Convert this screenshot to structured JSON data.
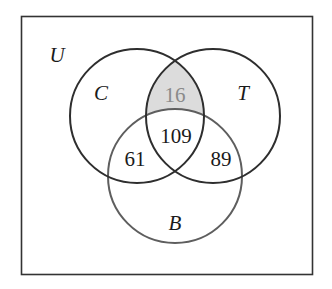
{
  "diagram": {
    "type": "venn",
    "universe": {
      "label": "U",
      "box": {
        "x": 21,
        "y": 16,
        "width": 292,
        "height": 259
      },
      "stroke": "#333333"
    },
    "sets": [
      {
        "id": "C",
        "label": "C",
        "cx": 137,
        "cy": 116,
        "r": 67,
        "stroke": "#2e2e2e"
      },
      {
        "id": "T",
        "label": "T",
        "cx": 213,
        "cy": 116,
        "r": 67,
        "stroke": "#2e2e2e"
      },
      {
        "id": "B",
        "label": "B",
        "cx": 175,
        "cy": 176,
        "r": 67,
        "stroke": "#5e5e5e"
      }
    ],
    "regions": [
      {
        "sets": [
          "C",
          "T"
        ],
        "excludes": [
          "B"
        ],
        "value": "16",
        "shaded": true,
        "fill": "#dcdcdc",
        "text_color": "#8a8a8a"
      },
      {
        "sets": [
          "C",
          "T",
          "B"
        ],
        "value": "109",
        "shaded": false
      },
      {
        "sets": [
          "C",
          "B"
        ],
        "excludes": [
          "T"
        ],
        "value": "61",
        "shaded": false
      },
      {
        "sets": [
          "T",
          "B"
        ],
        "excludes": [
          "C"
        ],
        "value": "89",
        "shaded": false
      }
    ]
  },
  "labels": {
    "universe": "U",
    "set_c": "C",
    "set_t": "T",
    "set_b": "B"
  },
  "values": {
    "c_and_t_only": "16",
    "all_three": "109",
    "c_and_b_only": "61",
    "t_and_b_only": "89"
  },
  "colors": {
    "shaded_fill": "#dcdcdc",
    "shaded_text": "#8a8a8a",
    "circle_dark": "#2e2e2e",
    "circle_b": "#5e5e5e",
    "text": "#1a1a1a"
  }
}
